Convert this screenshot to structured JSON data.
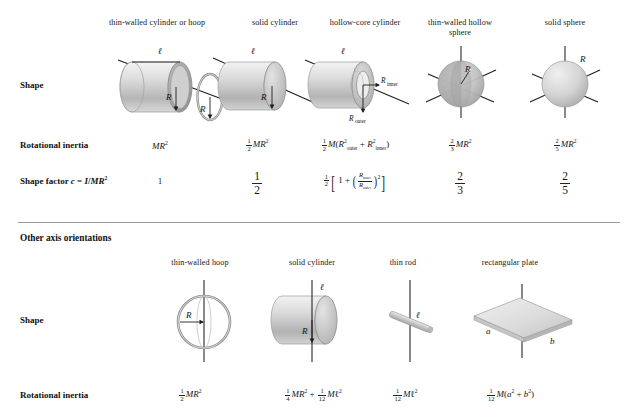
{
  "table": {
    "row_labels": {
      "shape": "Shape",
      "rotational_inertia": "Rotational inertia",
      "shape_factor": "Shape factor c = I/MR²"
    },
    "section_header": "Other axis orientations"
  },
  "top_section": {
    "columns": [
      {
        "header": "thin-walled cylinder or hoop",
        "header_line2": "",
        "shape_icon": "hoop-and-cylinder-icon",
        "dimension_labels": [
          "ℓ",
          "R",
          "R"
        ],
        "rotational_inertia": "MR²",
        "shape_factor": "1"
      },
      {
        "header": "solid cylinder",
        "header_line2": "",
        "shape_icon": "solid-cylinder-icon",
        "dimension_labels": [
          "ℓ",
          "R"
        ],
        "rotational_inertia": "½ MR²",
        "shape_factor": "1/2"
      },
      {
        "header": "hollow-core cylinder",
        "header_line2": "",
        "shape_icon": "hollow-core-cylinder-icon",
        "dimension_labels": [
          "ℓ",
          "R inner",
          "R outer"
        ],
        "rotational_inertia": "½ M(R²outer + R²inner)",
        "shape_factor": "½ [ 1 + (R inner / R outer)² ]"
      },
      {
        "header": "thin-walled hollow",
        "header_line2": "sphere",
        "shape_icon": "thin-walled-hollow-sphere-icon",
        "dimension_labels": [
          "R"
        ],
        "rotational_inertia": "⅔ MR²",
        "shape_factor": "2/3"
      },
      {
        "header": "solid sphere",
        "header_line2": "",
        "shape_icon": "solid-sphere-icon",
        "dimension_labels": [
          "R"
        ],
        "rotational_inertia": "⅖ MR²",
        "shape_factor": "2/5"
      }
    ]
  },
  "bottom_section": {
    "columns": [
      {
        "header": "thin-walled hoop",
        "shape_icon": "thin-walled-hoop-diameter-icon",
        "dimension_labels": [
          "R"
        ],
        "rotational_inertia": "½ MR²"
      },
      {
        "header": "solid cylinder",
        "shape_icon": "solid-cylinder-transverse-icon",
        "dimension_labels": [
          "ℓ",
          "R"
        ],
        "rotational_inertia": "¼ MR² + 1/12 Mℓ²"
      },
      {
        "header": "thin rod",
        "shape_icon": "thin-rod-icon",
        "dimension_labels": [
          "ℓ"
        ],
        "rotational_inertia": "1/12 Mℓ²"
      },
      {
        "header": "rectangular plate",
        "shape_icon": "rectangular-plate-icon",
        "dimension_labels": [
          "a",
          "b"
        ],
        "rotational_inertia": "1/12 M(a² + b²)"
      }
    ]
  },
  "colors": {
    "divider": "#9b9b9b",
    "text": "#161616",
    "axis": "#1d1d1d",
    "shape_light": "#e9e9e9",
    "shape_mid": "#cfcfcf",
    "shape_dark": "#a8a8a8"
  }
}
